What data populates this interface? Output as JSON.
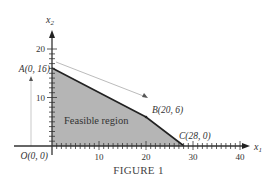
{
  "figure": {
    "caption": "FIGURE 1",
    "x_axis_label": "x",
    "x_axis_sub": "1",
    "y_axis_label": "x",
    "y_axis_sub": "2",
    "region_label": "Feasible region",
    "x_ticks": [
      "10",
      "20",
      "30",
      "40"
    ],
    "y_ticks": [
      "10",
      "20"
    ],
    "points": [
      {
        "name": "A",
        "label": "A(0, 16)",
        "x": 0,
        "y": 16
      },
      {
        "name": "B",
        "label": "B(20, 6)",
        "x": 20,
        "y": 6
      },
      {
        "name": "C",
        "label": "C(28, 0)",
        "x": 28,
        "y": 0
      },
      {
        "name": "O",
        "label": "O(0, 0)",
        "x": 0,
        "y": 0
      }
    ],
    "colors": {
      "region_fill": "#b5b5b5",
      "boundary": "#222222",
      "axis": "#333333",
      "arrow": "#999999"
    }
  }
}
